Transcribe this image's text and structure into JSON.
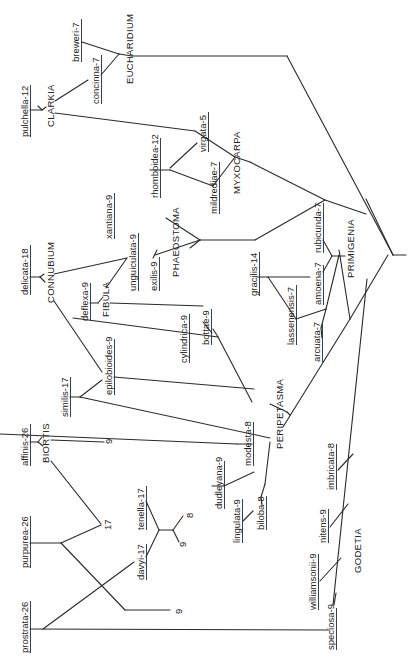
{
  "diagram": {
    "type": "phylogenetic-tree",
    "orientation": "rotated-90-ccw",
    "line_color": "#2a2a2a",
    "text_color": "#222222",
    "background": "#ffffff"
  },
  "sections": [
    {
      "id": "eucharidium",
      "label": "EUCHARIDIUM"
    },
    {
      "id": "clarkia",
      "label": "CLARKIA"
    },
    {
      "id": "myxocarpa",
      "label": "MYXOCARPA"
    },
    {
      "id": "connubium",
      "label": "CONNUBIUM"
    },
    {
      "id": "fibula",
      "label": "FIBULA"
    },
    {
      "id": "phaeostoma",
      "label": "PHAEOSTOMA"
    },
    {
      "id": "primigenia",
      "label": "PRIMIGENIA"
    },
    {
      "id": "peripetasma",
      "label": "PERIPETASMA"
    },
    {
      "id": "biortis",
      "label": "BIORTIS"
    },
    {
      "id": "godetia",
      "label": "GODETIA"
    }
  ],
  "species": [
    {
      "id": "breweri",
      "label": "breweri-7"
    },
    {
      "id": "concinna",
      "label": "concinna-7"
    },
    {
      "id": "pulchella",
      "label": "pulchella-12"
    },
    {
      "id": "virgata",
      "label": "virgata-5"
    },
    {
      "id": "rhomboidea",
      "label": "rhomboidea-12"
    },
    {
      "id": "mildrediae",
      "label": "mildrediae-7"
    },
    {
      "id": "xantiana",
      "label": "xantiana-9"
    },
    {
      "id": "unguiculata",
      "label": "unguiculata-9"
    },
    {
      "id": "exilis",
      "label": "exilis-9"
    },
    {
      "id": "delicata",
      "label": "delicata-18"
    },
    {
      "id": "deflexa",
      "label": "deflexa-9"
    },
    {
      "id": "bottae",
      "label": "bottae-9"
    },
    {
      "id": "cylindrica",
      "label": "cylindrica-9"
    },
    {
      "id": "gracilis",
      "label": "gracilis-14"
    },
    {
      "id": "rubicunda",
      "label": "rubicunda-7"
    },
    {
      "id": "amoena",
      "label": "amoena-7"
    },
    {
      "id": "lassenensis",
      "label": "lassenensis-7"
    },
    {
      "id": "arcuata",
      "label": "arcuata-7"
    },
    {
      "id": "similis",
      "label": "similis-17"
    },
    {
      "id": "epilobioides",
      "label": "epilobioides-9"
    },
    {
      "id": "modesta",
      "label": "modesta-8"
    },
    {
      "id": "dudleyana",
      "label": "dudleyana-9"
    },
    {
      "id": "lingulata",
      "label": "lingulata-9"
    },
    {
      "id": "biloba",
      "label": "biloba-8"
    },
    {
      "id": "imbricata",
      "label": "imbricata-8"
    },
    {
      "id": "nitens",
      "label": "nitens-9"
    },
    {
      "id": "williamsonii",
      "label": "williamsonii-9"
    },
    {
      "id": "speciosa",
      "label": "speciosa-9"
    },
    {
      "id": "affinis",
      "label": "affinis-26"
    },
    {
      "id": "purpurea",
      "label": "purpurea-26"
    },
    {
      "id": "tenella",
      "label": "tenella-17"
    },
    {
      "id": "davyi",
      "label": "davyi-17"
    },
    {
      "id": "prostrata",
      "label": "prostrata-26"
    }
  ],
  "hypothetical_numbers": [
    {
      "id": "n-biortis-9",
      "label": "9"
    },
    {
      "id": "n-17",
      "label": "17"
    },
    {
      "id": "n-8",
      "label": "8"
    },
    {
      "id": "n-9-small",
      "label": "9"
    },
    {
      "id": "n-9-bottom",
      "label": "9"
    }
  ]
}
